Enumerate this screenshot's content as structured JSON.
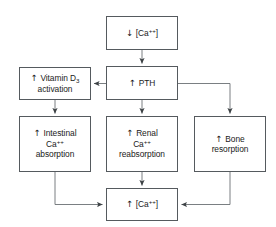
{
  "diagram": {
    "line_color": "#555a5e",
    "text_color": "#1a1a1a",
    "background": "#ffffff",
    "nodes": [
      {
        "id": "ca-low",
        "name": "node-decreased-serum-calcium",
        "text": "↓ [Ca⁺⁺]",
        "direction_arrow": "down",
        "lines": [
          "↓ [Ca++]"
        ]
      },
      {
        "id": "pth",
        "name": "node-increased-pth",
        "text": "↑ PTH",
        "direction_arrow": "up",
        "lines": [
          "↑ PTH"
        ]
      },
      {
        "id": "vitamind",
        "name": "node-vitamin-d3-activation",
        "text": "↑ Vitamin D3 activation",
        "direction_arrow": "up",
        "lines": [
          "↑ Vitamin D3",
          "activation"
        ]
      },
      {
        "id": "intestinal",
        "name": "node-intestinal-calcium-absorption",
        "text": "↑ Intestinal Ca++ absorption",
        "direction_arrow": "up",
        "lines": [
          "↑ Intestinal",
          "Ca++",
          "absorption"
        ]
      },
      {
        "id": "renal",
        "name": "node-renal-calcium-reabsorption",
        "text": "↑ Renal Ca++ reabsorption",
        "direction_arrow": "up",
        "lines": [
          "↑ Renal",
          "Ca++",
          "reabsorption"
        ]
      },
      {
        "id": "bone",
        "name": "node-bone-resorption",
        "text": "↑ Bone resorption",
        "direction_arrow": "up",
        "lines": [
          "↑ Bone",
          "resorption"
        ]
      },
      {
        "id": "ca-high",
        "name": "node-increased-serum-calcium",
        "text": "↑ [Ca⁺⁺]",
        "direction_arrow": "up",
        "lines": [
          "↑ [Ca++]"
        ]
      }
    ],
    "edges": [
      {
        "from": "ca-low",
        "to": "pth",
        "style": "straight-down"
      },
      {
        "from": "pth",
        "to": "vitamind",
        "style": "straight-left"
      },
      {
        "from": "pth",
        "to": "renal",
        "style": "straight-down"
      },
      {
        "from": "pth",
        "to": "bone",
        "style": "elbow-right-down"
      },
      {
        "from": "vitamind",
        "to": "intestinal",
        "style": "straight-down"
      },
      {
        "from": "intestinal",
        "to": "ca-high",
        "style": "elbow-down-right"
      },
      {
        "from": "renal",
        "to": "ca-high",
        "style": "straight-down"
      },
      {
        "from": "bone",
        "to": "ca-high",
        "style": "elbow-down-left"
      }
    ]
  },
  "text": {
    "ca_low_arrow": "↓",
    "ca_low_body": "[Ca",
    "ca_low_sup": "++",
    "ca_low_tail": "]",
    "pth_arrow": "↑",
    "pth_body": "PTH",
    "vitamind_arrow": "↑",
    "vitamind_body": "Vitamin D",
    "vitamind_sub": "3",
    "vitamind_line2": "activation",
    "intestinal_arrow": "↑",
    "intestinal_line1": "Intestinal",
    "intestinal_line2_body": "Ca",
    "intestinal_line2_sup": "++",
    "intestinal_line3": "absorption",
    "renal_arrow": "↑",
    "renal_line1": "Renal",
    "renal_line2_body": "Ca",
    "renal_line2_sup": "++",
    "renal_line3": "reabsorption",
    "bone_arrow": "↑",
    "bone_line1": "Bone",
    "bone_line2": "resorption",
    "ca_high_arrow": "↑",
    "ca_high_body": "[Ca",
    "ca_high_sup": "++",
    "ca_high_tail": "]"
  }
}
